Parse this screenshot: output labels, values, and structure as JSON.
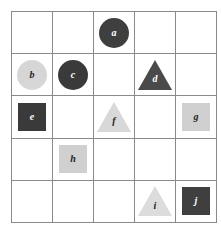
{
  "figure": {
    "name": "shape-grid",
    "rows": 5,
    "columns": 5,
    "background_color": "#ffffff",
    "grid_line_color": "#8a8a8a"
  },
  "palette": {
    "dark_fill": "#3f3f3f",
    "dark_fill_alt": "#3a3a3a",
    "light_fill": "#d6d6d6",
    "light_fill_alt": "#d0d0d0",
    "dark_text": "#222222",
    "light_text": "#ffffff"
  },
  "cells": [
    [
      {
        "label": "",
        "shape": "none"
      },
      {
        "label": "",
        "shape": "none"
      },
      {
        "label": "a",
        "shape": "circle",
        "fill": "#3f3f3f",
        "text_color": "#ffffff"
      },
      {
        "label": "",
        "shape": "none"
      },
      {
        "label": "",
        "shape": "none"
      }
    ],
    [
      {
        "label": "b",
        "shape": "circle",
        "fill": "#d6d6d6",
        "text_color": "#222222"
      },
      {
        "label": "c",
        "shape": "circle",
        "fill": "#3a3a3a",
        "text_color": "#ffffff"
      },
      {
        "label": "",
        "shape": "none"
      },
      {
        "label": "d",
        "shape": "triangle",
        "fill": "#4a4a4a",
        "text_color": "#ffffff"
      },
      {
        "label": "",
        "shape": "none"
      }
    ],
    [
      {
        "label": "e",
        "shape": "square",
        "fill": "#3a3a3a",
        "text_color": "#ffffff"
      },
      {
        "label": "",
        "shape": "none"
      },
      {
        "label": "f",
        "shape": "triangle",
        "fill": "#d8d8d8",
        "text_color": "#222222"
      },
      {
        "label": "",
        "shape": "none"
      },
      {
        "label": "g",
        "shape": "square",
        "fill": "#d0d0d0",
        "text_color": "#222222"
      }
    ],
    [
      {
        "label": "",
        "shape": "none"
      },
      {
        "label": "h",
        "shape": "square",
        "fill": "#d0d0d0",
        "text_color": "#222222"
      },
      {
        "label": "",
        "shape": "none"
      },
      {
        "label": "",
        "shape": "none"
      },
      {
        "label": "",
        "shape": "none"
      }
    ],
    [
      {
        "label": "",
        "shape": "none"
      },
      {
        "label": "",
        "shape": "none"
      },
      {
        "label": "",
        "shape": "none"
      },
      {
        "label": "i",
        "shape": "triangle",
        "fill": "#dcdcdc",
        "text_color": "#222222"
      },
      {
        "label": "j",
        "shape": "square",
        "fill": "#3f3f3f",
        "text_color": "#ffffff"
      }
    ]
  ]
}
